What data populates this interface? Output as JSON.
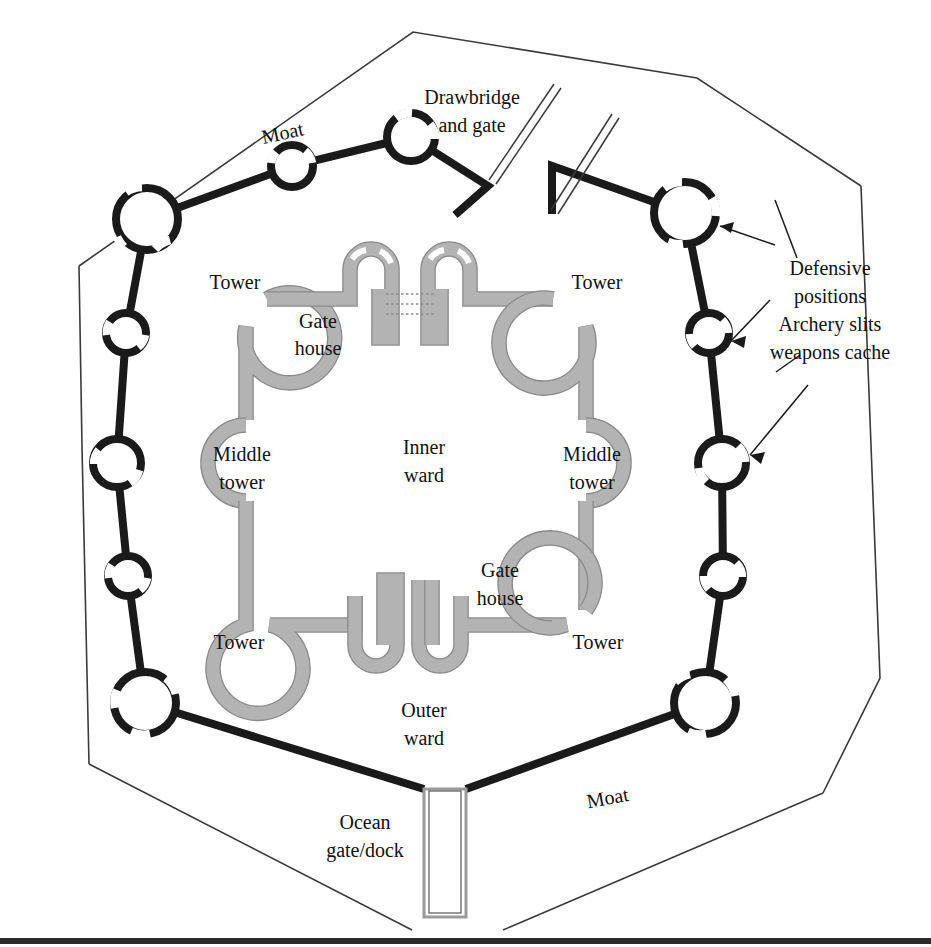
{
  "figure": {
    "kind": "architectural-floor-plan"
  },
  "colors": {
    "outer_wall": "#1a1a1a",
    "inner_wall_fill": "#b3b3b3",
    "inner_wall_edge": "#8a8a8a",
    "moat_outline": "#3a3a3a",
    "background": "#ffffff",
    "text": "#111111"
  },
  "labels": {
    "moat_top": "Moat",
    "moat_bottom": "Moat",
    "drawbridge_line1": "Drawbridge",
    "drawbridge_line2": "and gate",
    "tower_top_left": "Tower",
    "tower_top_right": "Tower",
    "tower_bottom_left": "Tower",
    "tower_bottom_right": "Tower",
    "gate_house_top_line1": "Gate",
    "gate_house_top_line2": "house",
    "gate_house_bottom_line1": "Gate",
    "gate_house_bottom_line2": "house",
    "middle_tower_left_line1": "Middle",
    "middle_tower_left_line2": "tower",
    "middle_tower_right_line1": "Middle",
    "middle_tower_right_line2": "tower",
    "inner_ward_line1": "Inner",
    "inner_ward_line2": "ward",
    "outer_ward_line1": "Outer",
    "outer_ward_line2": "ward",
    "ocean_gate_line1": "Ocean",
    "ocean_gate_line2": "gate/dock",
    "annotation_line1": "Defensive",
    "annotation_line2": "positions",
    "annotation_line3": "Archery slits",
    "annotation_line4": "weapons cache"
  },
  "structures": {
    "moat_boundary": {
      "shape": "octagon",
      "points": "79,266 413,32 697,78 861,186 880,678 823,793 503,930 412,930 89,764 82,447"
    },
    "outer_wall_nodes": [
      {
        "name": "corner-top-left",
        "cx": 147,
        "cy": 219,
        "r": 31
      },
      {
        "name": "mid-upper-top",
        "cx": 292,
        "cy": 166,
        "r": 21
      },
      {
        "name": "gate-node-top",
        "cx": 411,
        "cy": 137,
        "r": 24
      },
      {
        "name": "corner-top-right",
        "cx": 685,
        "cy": 213,
        "r": 31
      },
      {
        "name": "right-upper",
        "cx": 709,
        "cy": 333,
        "r": 20
      },
      {
        "name": "right-middle",
        "cx": 722,
        "cy": 463,
        "r": 24
      },
      {
        "name": "right-lower",
        "cx": 723,
        "cy": 576,
        "r": 20
      },
      {
        "name": "corner-bottom-right",
        "cx": 705,
        "cy": 703,
        "r": 31
      },
      {
        "name": "corner-bottom-left",
        "cx": 145,
        "cy": 703,
        "r": 31
      },
      {
        "name": "left-lower",
        "cx": 128,
        "cy": 576,
        "r": 20
      },
      {
        "name": "left-middle",
        "cx": 117,
        "cy": 463,
        "r": 24
      },
      {
        "name": "left-upper",
        "cx": 126,
        "cy": 333,
        "r": 20
      }
    ],
    "inner_towers": [
      {
        "name": "tower-top-left",
        "cx": 235,
        "cy": 283,
        "r": 45
      },
      {
        "name": "tower-top-right",
        "cx": 597,
        "cy": 283,
        "r": 45
      },
      {
        "name": "tower-bottom-left",
        "cx": 238,
        "cy": 641,
        "r": 45
      },
      {
        "name": "tower-bottom-right",
        "cx": 597,
        "cy": 641,
        "r": 45
      }
    ],
    "middle_towers": [
      {
        "name": "middle-tower-left",
        "cx": 212,
        "cy": 463,
        "r": 38,
        "facing": "left"
      },
      {
        "name": "middle-tower-right",
        "cx": 620,
        "cy": 463,
        "r": 38,
        "facing": "right"
      }
    ],
    "ocean_dock": {
      "x": 424,
      "y": 789,
      "width": 42,
      "height": 128
    },
    "drawbridge_planks": 2,
    "gatehouse_chain_lines": 3
  }
}
